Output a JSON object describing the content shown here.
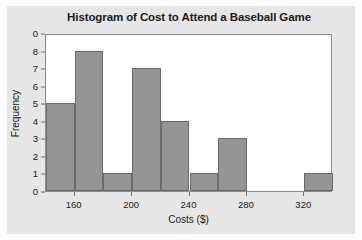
{
  "chart_data": {
    "type": "bar",
    "title": "Histogram of Cost to Attend a Baseball Game",
    "xlabel": "Costs ($)",
    "ylabel": "Frequency",
    "bin_width": 20,
    "bin_starts": [
      140,
      160,
      180,
      200,
      220,
      240,
      260,
      280,
      300,
      320
    ],
    "categories": [
      "140-160",
      "160-180",
      "180-200",
      "200-220",
      "220-240",
      "240-260",
      "260-280",
      "280-300",
      "300-320",
      "320-340"
    ],
    "values": [
      5,
      8,
      1,
      7,
      4,
      1,
      3,
      0,
      0,
      1
    ],
    "xlim": [
      140,
      340
    ],
    "ylim": [
      0,
      9
    ],
    "xticks": [
      160,
      200,
      240,
      280,
      320
    ],
    "xtick_labels": [
      "160",
      "200",
      "240",
      "280",
      "320"
    ],
    "yticks": [
      0,
      1,
      2,
      3,
      4,
      5,
      6,
      7,
      8,
      9
    ],
    "ytick_labels": [
      "0",
      "1",
      "2",
      "3",
      "4",
      "5",
      "6",
      "7",
      "8",
      "0"
    ],
    "grid": false,
    "legend": false,
    "bar_color": "#949494",
    "bar_edge_color": "#6b6b6b",
    "plot_background": "#ffffff",
    "figure_background": "#e6e6e6"
  }
}
